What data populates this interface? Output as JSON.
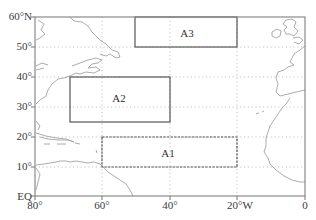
{
  "map": {
    "type": "regional_map",
    "projection": "equirectangular",
    "extent": {
      "lon_min": -80,
      "lon_max": 0,
      "lat_min": 0,
      "lat_max": 60
    },
    "grid": "dotted",
    "y_ticks": [
      {
        "lat": 60,
        "label": "60°N"
      },
      {
        "lat": 50,
        "label": "50°"
      },
      {
        "lat": 40,
        "label": "40°"
      },
      {
        "lat": 30,
        "label": "30°"
      },
      {
        "lat": 20,
        "label": "20°"
      },
      {
        "lat": 10,
        "label": "10°"
      },
      {
        "lat": 0,
        "label": "EQ"
      }
    ],
    "x_ticks": [
      {
        "lon": -80,
        "label": "80°"
      },
      {
        "lon": -60,
        "label": "60°"
      },
      {
        "lon": -40,
        "label": "40°"
      },
      {
        "lon": -20,
        "label": "20°W"
      },
      {
        "lon": 0,
        "label": "0"
      }
    ],
    "regions": [
      {
        "name": "A1",
        "lon_w": -60,
        "lon_e": -20,
        "lat_s": 10,
        "lat_n": 20,
        "style": "dashed"
      },
      {
        "name": "A2",
        "lon_w": -70,
        "lon_e": -40,
        "lat_s": 26,
        "lat_n": 40,
        "style": "solid"
      },
      {
        "name": "A3",
        "lon_w": -50,
        "lon_e": -20,
        "lat_s": 50,
        "lat_n": 60,
        "style": "solid"
      }
    ],
    "colors": {
      "frame": "#8a8a8a",
      "box": "#555555",
      "coast": "#a0a0a0",
      "grid": "#b5b5b5"
    }
  }
}
